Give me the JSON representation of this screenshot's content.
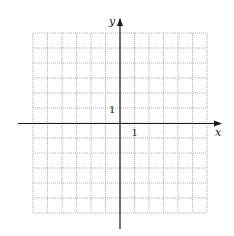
{
  "diagram": {
    "type": "coordinate-grid",
    "axes": {
      "x_label": "x",
      "y_label": "y",
      "x_tick_label": "1",
      "y_tick_label": "1"
    },
    "grid": {
      "columns": 12,
      "rows": 12,
      "x_range": [
        -6,
        6
      ],
      "y_range": [
        -6,
        6
      ],
      "line_style": "dotted",
      "line_color": "#9a9a9a"
    },
    "colors": {
      "axis": "#1a1a1a",
      "background": "#ffffff"
    }
  }
}
